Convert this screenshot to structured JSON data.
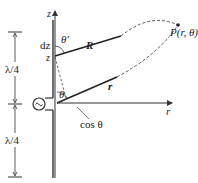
{
  "diagram": {
    "type": "half-wave dipole antenna geometry",
    "labels": {
      "z_axis": "z",
      "r_axis": "r",
      "dz": "dz",
      "z_point": "z",
      "theta_prime": "θ′",
      "theta": "θ",
      "R_vector": "R",
      "r_vector": "r",
      "point": "P(r, θ)",
      "lambda_upper": "λ/4",
      "lambda_lower": "λ/4",
      "cos_label": "cos θ"
    },
    "colors": {
      "line": "#333333",
      "background": "#ffffff"
    }
  }
}
